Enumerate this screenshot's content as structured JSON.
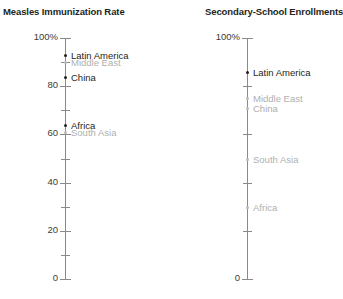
{
  "chart_data": [
    {
      "type": "scatter",
      "title": "Measles Immunization Rate",
      "xlabel": "",
      "ylabel": "",
      "ylim": [
        0,
        100
      ],
      "grid": false,
      "legend": "none",
      "axis_x_px": 65,
      "tick_labels": [
        "100%",
        "80",
        "60",
        "40",
        "20",
        "0"
      ],
      "tick_values": [
        100,
        80,
        60,
        40,
        20,
        0
      ],
      "minor_tick_values": [
        90,
        70,
        50,
        30,
        10
      ],
      "categories": [
        "Latin America",
        "Middle East",
        "China",
        "Africa",
        "South Asia"
      ],
      "values": [
        93,
        90,
        84,
        64,
        61
      ],
      "points": [
        {
          "label": "Latin America",
          "value": 93,
          "muted": false,
          "label_dy": -4
        },
        {
          "label": "Middle East",
          "value": 90,
          "muted": true,
          "label_dy": -4
        },
        {
          "label": "China",
          "value": 84,
          "muted": false,
          "label_dy": -4
        },
        {
          "label": "Africa",
          "value": 64,
          "muted": false,
          "label_dy": -4
        },
        {
          "label": "South Asia",
          "value": 61,
          "muted": true,
          "label_dy": -4
        }
      ]
    },
    {
      "type": "scatter",
      "title": "Secondary-School Enrollments",
      "xlabel": "",
      "ylabel": "",
      "ylim": [
        0,
        100
      ],
      "grid": false,
      "legend": "none",
      "axis_x_px": 84,
      "tick_labels": [
        "100%",
        "0"
      ],
      "tick_values": [
        100,
        0
      ],
      "minor_tick_values": [
        80,
        60,
        40,
        20
      ],
      "categories": [
        "Latin America",
        "Middle East",
        "China",
        "South Asia",
        "Africa"
      ],
      "values": [
        86,
        75,
        71,
        50,
        30
      ],
      "points": [
        {
          "label": "Latin America",
          "value": 86,
          "muted": false,
          "label_dy": -4
        },
        {
          "label": "Middle East",
          "value": 75,
          "muted": true,
          "label_dy": -4
        },
        {
          "label": "China",
          "value": 71,
          "muted": true,
          "label_dy": -4
        },
        {
          "label": "South Asia",
          "value": 50,
          "muted": true,
          "label_dy": -4
        },
        {
          "label": "Africa",
          "value": 30,
          "muted": true,
          "label_dy": -4
        }
      ]
    }
  ],
  "colors": {
    "text": "#231f20",
    "muted_text": "#b0b0b0",
    "axis": "#8a8a8a",
    "background": "#ffffff"
  },
  "panels": {
    "left": {
      "title": "Measles Immunization Rate"
    },
    "right": {
      "title": "Secondary-School Enrollments"
    }
  }
}
